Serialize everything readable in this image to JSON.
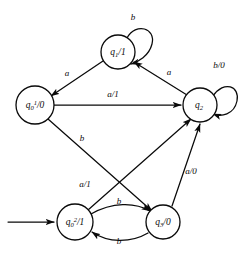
{
  "diagram": {
    "background_color": "#ffffff",
    "stroke_color": "#0a0a0a",
    "width": 243,
    "height": 253,
    "start_marker": "start-arrow",
    "start_state": "q_0^2"
  },
  "nodes": [
    {
      "id": "q_0^1",
      "label_base": "q",
      "label_sub": "0",
      "label_sup": "1",
      "label_output": "/0",
      "label_full": "q₀¹/0",
      "cx": 35,
      "cy": 105,
      "r": 19
    },
    {
      "id": "q_1",
      "label_base": "q",
      "label_sub": "1",
      "label_sup": "",
      "label_output": "/1",
      "label_full": "q₁/1",
      "cx": 118,
      "cy": 52,
      "r": 17
    },
    {
      "id": "q_2",
      "label_base": "q",
      "label_sub": "2",
      "label_sup": "",
      "label_output": "",
      "label_full": "q₂",
      "cx": 200,
      "cy": 105,
      "r": 17
    },
    {
      "id": "q_0^2",
      "label_base": "q",
      "label_sub": "0",
      "label_sup": "2",
      "label_output": "/1",
      "label_full": "q₀²/1",
      "cx": 75,
      "cy": 222,
      "r": 18
    },
    {
      "id": "q_3",
      "label_base": "q",
      "label_sub": "3",
      "label_sup": "",
      "label_output": "/0",
      "label_full": "q₃/0",
      "cx": 163,
      "cy": 222,
      "r": 17
    }
  ],
  "edges": [
    {
      "id": "edge-q1-to-q0a",
      "from": "q_1",
      "to": "q_0^1",
      "label": "a",
      "label_x": 67,
      "label_y": 74
    },
    {
      "id": "edge-q2-to-q1",
      "from": "q_2",
      "to": "q_1",
      "label": "a",
      "label_x": 169,
      "label_y": 73
    },
    {
      "id": "edge-q1-self-loop",
      "from": "q_1",
      "to": "q_1",
      "label": "b",
      "label_x": 133,
      "label_y": 18
    },
    {
      "id": "edge-q2-self-loop",
      "from": "q_2",
      "to": "q_2",
      "label": "b/0",
      "label_x": 218,
      "label_y": 66
    },
    {
      "id": "edge-q0a-to-q2",
      "from": "q_0^1",
      "to": "q_2",
      "label": "a/1",
      "label_x": 113,
      "label_y": 95
    },
    {
      "id": "edge-q0a-to-q3",
      "from": "q_0^1",
      "to": "q_3",
      "label": "b",
      "label_x": 82,
      "label_y": 139
    },
    {
      "id": "edge-q0b-to-q2",
      "from": "q_0^2",
      "to": "q_2",
      "label": "a/1",
      "label_x": 85,
      "label_y": 185
    },
    {
      "id": "edge-q3-to-q2",
      "from": "q_3",
      "to": "q_2",
      "label": "a/0",
      "label_x": 190,
      "label_y": 172
    },
    {
      "id": "edge-q0b-to-q3",
      "from": "q_0^2",
      "to": "q_3",
      "label": "b",
      "label_x": 119,
      "label_y": 204
    },
    {
      "id": "edge-q3-to-q0b",
      "from": "q_3",
      "to": "q_0^2",
      "label": "b",
      "label_x": 119,
      "label_y": 240
    }
  ]
}
